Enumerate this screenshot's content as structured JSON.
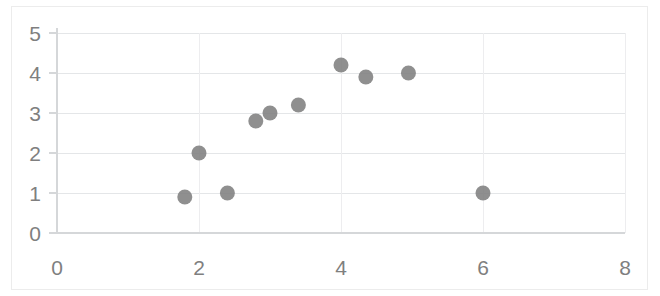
{
  "chart_data": {
    "type": "scatter",
    "title": "",
    "subtitle": "",
    "xlabel": "",
    "ylabel": "",
    "xlim": [
      0,
      8
    ],
    "ylim": [
      0,
      5
    ],
    "xticks": [
      0,
      2,
      4,
      6,
      8
    ],
    "yticks": [
      0,
      1,
      2,
      3,
      4,
      5
    ],
    "xtick_labels": [
      "0",
      "2",
      "4",
      "6",
      "8"
    ],
    "ytick_labels": [
      "0",
      "1",
      "2",
      "3",
      "4",
      "5"
    ],
    "grid": {
      "horizontal": true,
      "vertical": false,
      "color": "#e4e6e8"
    },
    "legend": {
      "visible": false,
      "position": "none",
      "entries": []
    },
    "annotations": [],
    "series": [
      {
        "name": "Series 1",
        "marker": "circle",
        "color": "#808080",
        "marker_size": 15,
        "points": [
          {
            "x": 1.8,
            "y": 0.9
          },
          {
            "x": 2.0,
            "y": 2.0
          },
          {
            "x": 2.4,
            "y": 1.0
          },
          {
            "x": 2.8,
            "y": 2.8
          },
          {
            "x": 3.0,
            "y": 3.0
          },
          {
            "x": 3.4,
            "y": 3.2
          },
          {
            "x": 4.0,
            "y": 4.2
          },
          {
            "x": 4.35,
            "y": 3.9
          },
          {
            "x": 4.95,
            "y": 4.0
          },
          {
            "x": 6.0,
            "y": 1.0
          }
        ]
      }
    ]
  },
  "style": {
    "background": "#ffffff",
    "border_color": "#ececec",
    "axis_color": "#d5d7d9",
    "tick_label_color": "#7f7f7f",
    "marker_color": "#808080"
  }
}
